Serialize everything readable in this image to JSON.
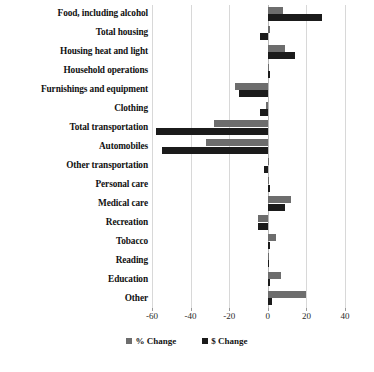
{
  "chart_data": {
    "type": "bar",
    "orientation": "horizontal",
    "title": "",
    "subtitle": "",
    "xlabel": "",
    "ylabel": "",
    "xlim": [
      -60,
      40
    ],
    "xticks": [
      -60,
      -40,
      -20,
      0,
      20,
      40
    ],
    "xtick_labels": [
      "-60",
      "-40",
      "-20",
      "0",
      "20",
      "40"
    ],
    "grid": true,
    "grid_axis": "x",
    "legend_position": "bottom",
    "categories": [
      "Food, including alcohol",
      "Total housing",
      "Housing heat and light",
      "Household operations",
      "Furnishings and equipment",
      "Clothing",
      "Total transportation",
      "Automobiles",
      "Other transportation",
      "Personal care",
      "Medical care",
      "Recreation",
      "Tobacco",
      "Reading",
      "Education",
      "Other"
    ],
    "series": [
      {
        "name": "% Change",
        "color": "#6d6d6d",
        "values": [
          8,
          1,
          9,
          0,
          -17,
          -1,
          -28,
          -32,
          0,
          0,
          12,
          -5,
          4,
          0,
          7,
          20
        ]
      },
      {
        "name": "$ Change",
        "color": "#1b1b1b",
        "values": [
          28,
          -4,
          14,
          1,
          -15,
          -4,
          -58,
          -55,
          -2,
          1,
          9,
          -5,
          1,
          0,
          1,
          2
        ]
      }
    ]
  },
  "legend": {
    "items": [
      {
        "label": "% Change",
        "swatch": "gray-square-icon"
      },
      {
        "label": "$ Change",
        "swatch": "black-square-icon"
      }
    ]
  },
  "page_bleed": {
    "text": ""
  }
}
